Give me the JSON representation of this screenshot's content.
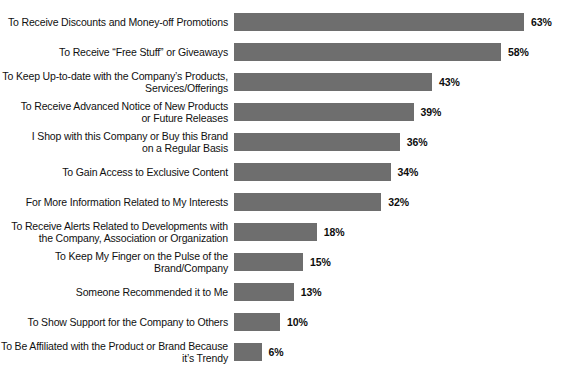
{
  "chart_data": {
    "type": "bar",
    "orientation": "horizontal",
    "title": "",
    "subtitle": "",
    "xlabel": "",
    "ylabel": "",
    "xlim": [
      0,
      63
    ],
    "grid": false,
    "legend": null,
    "value_suffix": "%",
    "bar_color": "#6e6e6e",
    "background_color": "#ffffff",
    "categories": [
      "To Receive Discounts and Money-off Promotions",
      "To Receive “Free Stuff” or Giveaways",
      "To Keep Up-to-date with the Company’s Products,\nServices/Offerings",
      "To Receive Advanced Notice of New Products\nor Future Releases",
      "I Shop with this Company or Buy this Brand\non a Regular Basis",
      "To Gain Access to Exclusive Content",
      "For More Information Related to My Interests",
      "To Receive Alerts Related to Developments with\nthe Company, Association or Organization",
      "To Keep My Finger on the Pulse of the\nBrand/Company",
      "Someone Recommended it to Me",
      "To Show Support for the Company to Others",
      "To Be Affiliated with the Product or Brand Because\nit’s Trendy"
    ],
    "values": [
      63,
      58,
      43,
      39,
      36,
      34,
      32,
      18,
      15,
      13,
      10,
      6
    ],
    "value_labels": [
      "63%",
      "58%",
      "43%",
      "39%",
      "36%",
      "34%",
      "32%",
      "18%",
      "15%",
      "13%",
      "10%",
      "6%"
    ]
  }
}
